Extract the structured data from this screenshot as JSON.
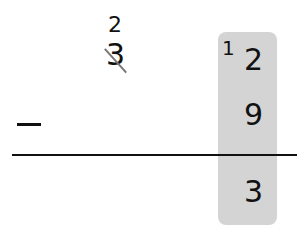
{
  "problem": {
    "operation": "subtraction",
    "operator_symbol": "−",
    "minuend": {
      "tens": {
        "original": "3",
        "crossed_out": true,
        "regrouped_value": "2"
      },
      "ones": {
        "original": "2",
        "borrowed_prefix": "1",
        "regrouped_value": "12"
      }
    },
    "subtrahend": {
      "ones": "9"
    },
    "difference": {
      "ones": "3"
    },
    "highlight": {
      "column": "ones",
      "color": "#d4d4d4"
    }
  }
}
